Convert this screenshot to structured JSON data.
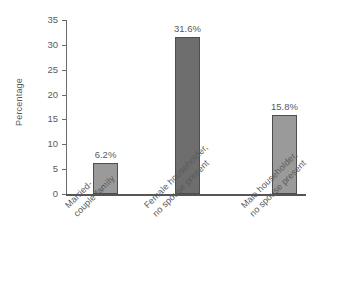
{
  "chart_data": {
    "type": "bar",
    "title": "",
    "xlabel": "",
    "ylabel": "Percentage",
    "ylim": [
      0,
      35
    ],
    "ytick_step": 5,
    "grid": false,
    "legend": "none",
    "categories": [
      "Married-couple family",
      "Female householder, no spouse present",
      "Male householder, no spouse present"
    ],
    "category_lines": [
      [
        "Married-",
        "couple family"
      ],
      [
        "Female householder,",
        "no spouse present"
      ],
      [
        "Male householder,",
        "no spouse present"
      ]
    ],
    "values": [
      6.2,
      31.6,
      15.8
    ],
    "value_labels": [
      "6.2%",
      "31.6%",
      "15.8%"
    ],
    "ytick_labels": [
      "0",
      "5",
      "10",
      "15",
      "20",
      "25",
      "30",
      "35"
    ],
    "bar_colors": [
      "#9a9a9a",
      "#6e6e6e",
      "#9a9a9a"
    ],
    "bar_border_color": "#4e4e4e",
    "axis_color": "#555555",
    "background": "#ffffff",
    "text_color": "#5a5a5a"
  }
}
